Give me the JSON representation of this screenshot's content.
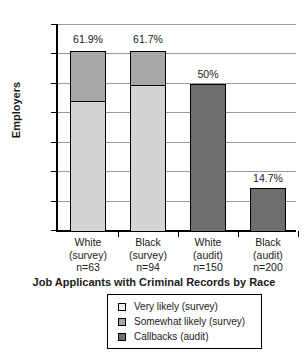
{
  "chart_data": {
    "type": "bar",
    "subtype": "stacked-bar",
    "title": "",
    "xlabel": "Job Applicants with Criminal Records by Race",
    "ylabel": "Employers",
    "ylim": [
      0,
      70
    ],
    "ytick_labels": [
      "70.0%",
      "60.0%",
      "50.0%",
      "40.0%",
      "30.0%",
      "20.0%",
      "10.0%",
      "0.0%"
    ],
    "ytick_values": [
      70,
      60,
      50,
      40,
      30,
      20,
      10,
      0
    ],
    "grid": "horizontal",
    "legend_position": "below-axis-centered",
    "categories": [
      "White (survey) n=63",
      "Black (survey) n=94",
      "White (audit) n=150",
      "Black (audit) n=200"
    ],
    "category_lines": [
      [
        "White",
        "(survey)",
        "n=63"
      ],
      [
        "Black",
        "(survey)",
        "n=94"
      ],
      [
        "White",
        "(audit)",
        "n=150"
      ],
      [
        "Black",
        "(audit)",
        "n=200"
      ]
    ],
    "series": [
      {
        "name": "Very likely (survey)",
        "color": "#d4d4d4",
        "values": [
          44.4,
          49.7,
          0,
          0
        ]
      },
      {
        "name": "Somewhat likely (survey)",
        "color": "#a8a8a8",
        "values": [
          17.5,
          12.0,
          0,
          0
        ]
      },
      {
        "name": "Callbacks (audit)",
        "color": "#6e6e6e",
        "values": [
          0,
          0,
          50,
          14.7
        ]
      }
    ],
    "totals": [
      61.9,
      61.7,
      50,
      14.7
    ],
    "bar_value_labels": [
      "61.9%",
      "61.7%",
      "50%",
      "14.7%"
    ]
  },
  "legend": {
    "items": [
      {
        "label": "Very likely (survey)",
        "tone": "light"
      },
      {
        "label": "Somewhat likely (survey)",
        "tone": "medium"
      },
      {
        "label": "Callbacks (audit)",
        "tone": "dark"
      }
    ]
  },
  "colors": {
    "light": "#d4d4d4",
    "medium": "#a8a8a8",
    "dark": "#6e6e6e",
    "axis": "#000000",
    "grid": "#9a9a9a",
    "background": "#ffffff"
  }
}
